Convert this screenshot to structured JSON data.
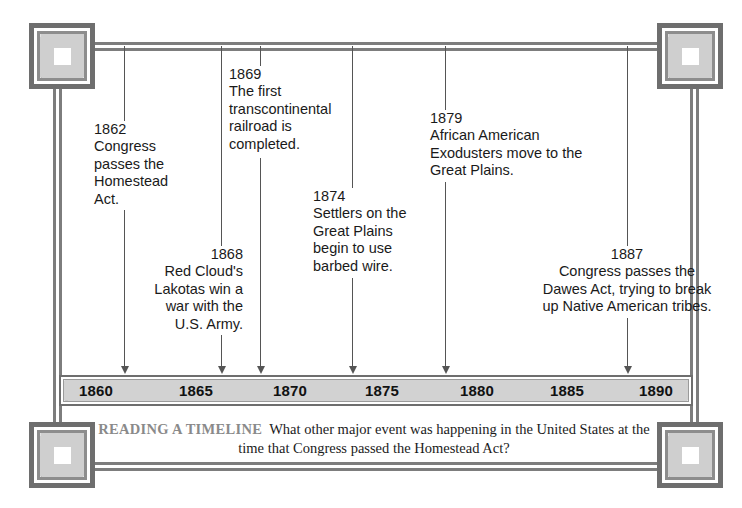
{
  "page": {
    "background_color": "#ffffff",
    "frame_color": "#7d7d7d",
    "ornament_fill": "#cfcfcf",
    "bar_fill": "#d2d2d2",
    "text_color": "#1a1a1a"
  },
  "axis": {
    "ticks": [
      {
        "label": "1860",
        "x": 96
      },
      {
        "label": "1865",
        "x": 196
      },
      {
        "label": "1870",
        "x": 290
      },
      {
        "label": "1875",
        "x": 382
      },
      {
        "label": "1880",
        "x": 477
      },
      {
        "label": "1885",
        "x": 567
      },
      {
        "label": "1890",
        "x": 656
      }
    ],
    "range": [
      1858,
      1892
    ]
  },
  "events": [
    {
      "year": "1862",
      "text": "1862\nCongress\npasses the\nHomestead\nAct.",
      "align": "left",
      "marker_x": 124
    },
    {
      "year": "1868",
      "text": "1868\nRed Cloud's\nLakotas win a\nwar with the\nU.S. Army.",
      "align": "right",
      "marker_x": 221
    },
    {
      "year": "1869",
      "text": "1869\nThe first\ntranscontinental\nrailroad is\ncompleted.",
      "align": "left",
      "marker_x": 260
    },
    {
      "year": "1874",
      "text": "1874\nSettlers on the\nGreat Plains\nbegin to use\nbarbed wire.",
      "align": "left",
      "marker_x": 352
    },
    {
      "year": "1879",
      "text": "1879\nAfrican American\nExodusters move to the\nGreat Plains.",
      "align": "left",
      "marker_x": 445
    },
    {
      "year": "1887",
      "text": "1887\nCongress passes the\nDawes Act, trying to break\nup Native American tribes.",
      "align": "center",
      "marker_x": 627
    }
  ],
  "caption": {
    "tag": "READING A TIMELINE",
    "question": "What other major event was happening in the United States at the time that Congress passed the Homestead Act?"
  },
  "ornaments": [
    {
      "position": "top-left"
    },
    {
      "position": "top-right"
    },
    {
      "position": "bottom-left"
    },
    {
      "position": "bottom-right"
    }
  ]
}
